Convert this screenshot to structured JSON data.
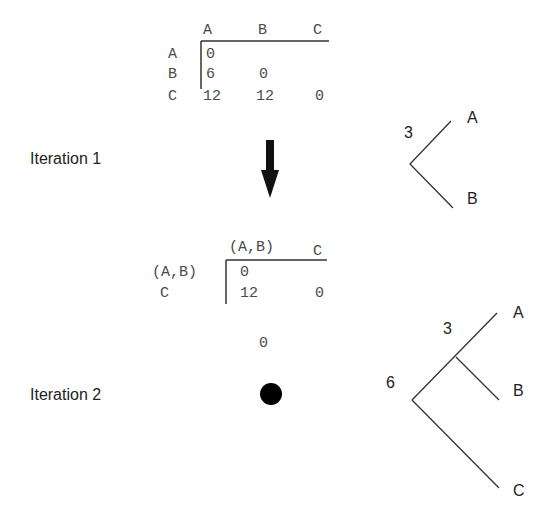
{
  "iteration1": {
    "label": "Iteration 1",
    "matrix": {
      "col_headers": [
        "A",
        "B",
        "C"
      ],
      "row_headers": [
        "A",
        "B",
        "C"
      ],
      "rows": [
        [
          "0",
          "",
          ""
        ],
        [
          "6",
          "0",
          ""
        ],
        [
          "12",
          "12",
          "0"
        ]
      ]
    },
    "tree": {
      "node_height": "3",
      "leaves": [
        "A",
        "B"
      ]
    }
  },
  "iteration2": {
    "label": "Iteration 2",
    "matrix": {
      "col_headers": [
        "(A,B)",
        "C"
      ],
      "row_headers": [
        "(A,B)",
        "C"
      ],
      "rows": [
        [
          "0",
          ""
        ],
        [
          "12",
          "0"
        ]
      ]
    },
    "single_value": "0",
    "tree": {
      "inner_height": "3",
      "root_height": "6",
      "leaves": [
        "A",
        "B",
        "C"
      ]
    }
  },
  "colors": {
    "text": "#4a4a4a",
    "lines": "#333333",
    "arrow": "#111111"
  }
}
